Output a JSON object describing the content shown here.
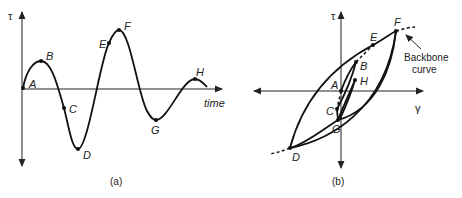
{
  "panel_a": {
    "caption": "(a)",
    "y_axis_label": "τ",
    "x_axis_label": "time",
    "points": {
      "A": "A",
      "B": "B",
      "C": "C",
      "D": "D",
      "E": "E",
      "F": "F",
      "G": "G",
      "H": "H"
    }
  },
  "panel_b": {
    "caption": "(b)",
    "y_axis_label": "τ",
    "x_axis_label": "γ",
    "points": {
      "A": "A",
      "B": "B",
      "C": "C",
      "D": "D",
      "E": "E",
      "F": "F",
      "G": "G",
      "H": "H"
    },
    "annotation_line1": "Backbone",
    "annotation_line2": "curve"
  }
}
